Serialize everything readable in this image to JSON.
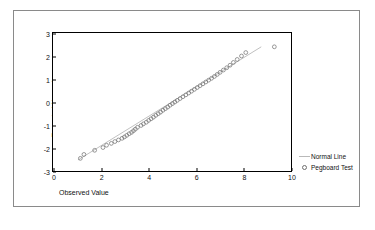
{
  "chart_data": {
    "type": "scatter",
    "title": "",
    "xlabel": "Observed Value",
    "ylabel": "Expected Normal",
    "xlim": [
      0,
      10
    ],
    "ylim": [
      -3,
      3
    ],
    "xticks": [
      "0",
      "2",
      "4",
      "6",
      "8",
      "10"
    ],
    "xtick_values": [
      0,
      2,
      4,
      6,
      8,
      10
    ],
    "yticks": [
      "3",
      "2",
      "1",
      "0",
      "-1",
      "-2",
      "-3"
    ],
    "ytick_values": [
      3,
      2,
      1,
      0,
      -1,
      -2,
      -3
    ],
    "grid": false,
    "legend_position": "right-outside",
    "series": [
      {
        "name": "Normal Line",
        "type": "line",
        "style": "solid-thin",
        "color": "#b0b0b0",
        "x": [
          1.05,
          8.75
        ],
        "y": [
          -2.52,
          2.4
        ]
      },
      {
        "name": "Pegboard Test",
        "type": "scatter",
        "marker": "open-circle",
        "color": "#6f6f6f",
        "x": [
          1.15,
          1.3,
          1.75,
          2.1,
          2.25,
          2.45,
          2.6,
          2.75,
          2.9,
          3.0,
          3.1,
          3.2,
          3.3,
          3.38,
          3.46,
          3.55,
          3.7,
          3.8,
          3.92,
          4.02,
          4.12,
          4.22,
          4.32,
          4.42,
          4.52,
          4.62,
          4.72,
          4.82,
          4.92,
          5.02,
          5.12,
          5.22,
          5.34,
          5.46,
          5.58,
          5.7,
          5.82,
          5.94,
          6.06,
          6.18,
          6.3,
          6.42,
          6.54,
          6.66,
          6.78,
          6.9,
          7.02,
          7.16,
          7.3,
          7.44,
          7.58,
          7.74,
          7.92,
          8.1,
          9.3
        ],
        "y": [
          -2.45,
          -2.28,
          -2.1,
          -1.98,
          -1.88,
          -1.8,
          -1.72,
          -1.65,
          -1.58,
          -1.52,
          -1.45,
          -1.38,
          -1.32,
          -1.25,
          -1.18,
          -1.1,
          -1.02,
          -0.95,
          -0.88,
          -0.8,
          -0.73,
          -0.66,
          -0.58,
          -0.51,
          -0.44,
          -0.36,
          -0.29,
          -0.22,
          -0.14,
          -0.07,
          0.0,
          0.07,
          0.15,
          0.23,
          0.31,
          0.39,
          0.47,
          0.55,
          0.63,
          0.71,
          0.79,
          0.87,
          0.95,
          1.03,
          1.11,
          1.2,
          1.29,
          1.39,
          1.49,
          1.6,
          1.72,
          1.85,
          2.0,
          2.15,
          2.4
        ]
      }
    ]
  },
  "legend": {
    "entries": [
      {
        "label": "Normal Line",
        "marker": "line-swatch"
      },
      {
        "label": "Pegboard Test",
        "marker": "open-circle-swatch"
      }
    ]
  }
}
